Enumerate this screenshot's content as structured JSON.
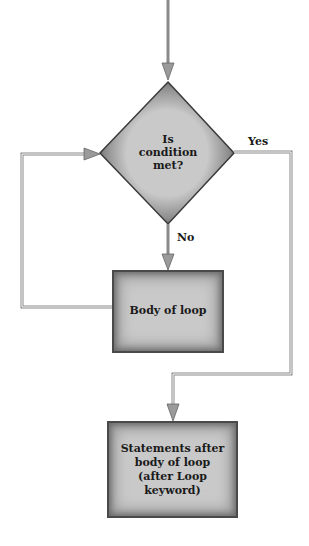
{
  "diagram": {
    "type": "flowchart",
    "decision": {
      "text_lines": [
        "Is",
        "condition",
        "met?"
      ]
    },
    "process_body": {
      "text": "Body of loop"
    },
    "process_after": {
      "text_lines": [
        "Statements after",
        "body of loop",
        "(after Loop",
        "keyword)"
      ]
    },
    "edge_labels": {
      "yes": "Yes",
      "no": "No"
    },
    "colors": {
      "node_fill": "#c9c9c9",
      "node_border": "#4a4a4a",
      "line": "#8a8a8a",
      "arrow": "#9a9a9a"
    }
  }
}
